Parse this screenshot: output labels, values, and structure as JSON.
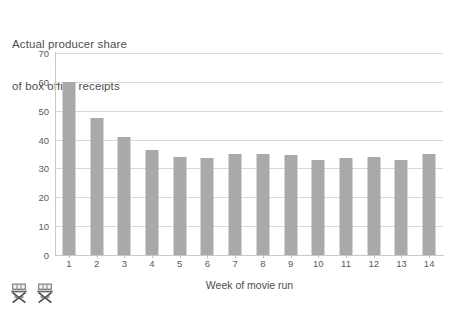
{
  "chart_data": {
    "type": "bar",
    "title": "Actual producer share\nof box office receipts",
    "title_lines": [
      "Actual producer share",
      "of box office receipts"
    ],
    "xlabel": "Week of movie run",
    "ylabel": "",
    "categories": [
      "1",
      "2",
      "3",
      "4",
      "5",
      "6",
      "7",
      "8",
      "9",
      "10",
      "11",
      "12",
      "13",
      "14"
    ],
    "values": [
      60,
      47.5,
      41,
      36.5,
      34,
      33.5,
      35,
      35,
      34.5,
      33,
      33.5,
      34,
      33,
      35
    ],
    "series": [
      {
        "name": "Actual producer share of box office receipts",
        "values": [
          60,
          47.5,
          41,
          36.5,
          34,
          33.5,
          35,
          35,
          34.5,
          33,
          33.5,
          34,
          33,
          35
        ]
      }
    ],
    "ylim": [
      0,
      70
    ],
    "xlim": [
      0.5,
      14.5
    ],
    "yticks": [
      0,
      10,
      20,
      30,
      40,
      50,
      60,
      70
    ],
    "ytick_labels": [
      "0",
      "10",
      "20",
      "30",
      "40",
      "50",
      "60",
      "70"
    ],
    "xtick_labels": [
      "1",
      "2",
      "3",
      "4",
      "5",
      "6",
      "7",
      "8",
      "9",
      "10",
      "11",
      "12",
      "13",
      "14"
    ],
    "grid": true,
    "grid_axis": "y",
    "legend": false,
    "legend_position": "none",
    "bar_color": "#a9a9a9",
    "gridline_color": "#d7d7d7",
    "axis_color": "#c9c9c9",
    "text_color": "#4d4d4d",
    "background_color": "#ffffff",
    "annotations": []
  },
  "decoration": {
    "icons": [
      {
        "name": "directors-chair-icon",
        "label": "director's chair"
      },
      {
        "name": "directors-chair-icon",
        "label": "director's chair"
      }
    ]
  }
}
